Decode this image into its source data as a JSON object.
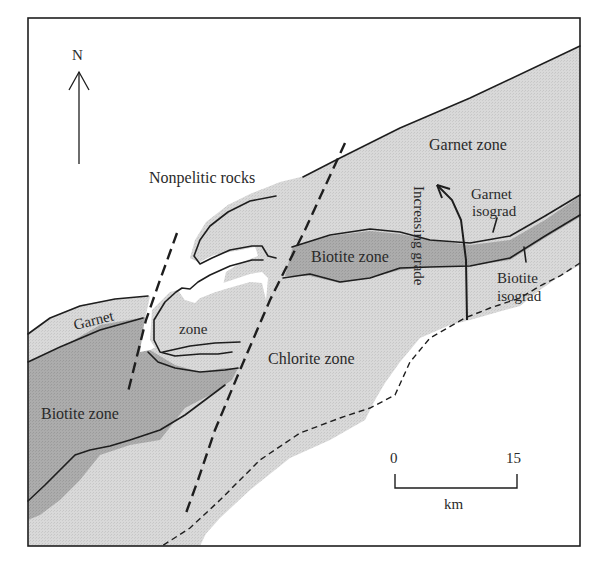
{
  "map": {
    "north_label": "N",
    "region_labels": {
      "nonpelitic": "Nonpelitic rocks",
      "garnet_zone_ne": "Garnet zone",
      "biotite_zone_center": "Biotite zone",
      "chlorite_zone": "Chlorite zone",
      "garnet_w": "Garnet",
      "zone_w": "zone",
      "biotite_zone_w": "Biotite zone"
    },
    "isograds": {
      "garnet_line1": "Garnet",
      "garnet_line2": "isograd",
      "biotite_line1": "Biotite",
      "biotite_line2": "isograd"
    },
    "grade_arrow_label": "Increasing grade",
    "scale_bar": {
      "start": "0",
      "end": "15",
      "unit": "km"
    },
    "colors": {
      "light_zone": "#d6d6d6",
      "dark_zone": "#a9a9a9",
      "background": "#ffffff",
      "line": "#1e1e1e"
    }
  }
}
